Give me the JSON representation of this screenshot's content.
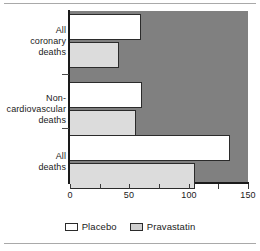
{
  "chart_data": {
    "type": "bar",
    "orientation": "horizontal",
    "title": "",
    "xlabel": "",
    "ylabel": "",
    "categories": [
      "All coronary deaths",
      "Non-cardiovascular deaths",
      "All deaths"
    ],
    "category_lines": [
      [
        "All",
        "coronary",
        "deaths"
      ],
      [
        "Non-",
        "cardiovascular",
        "deaths"
      ],
      [
        "All",
        "deaths"
      ]
    ],
    "series": [
      {
        "name": "Placebo",
        "values": [
          60,
          61,
          135
        ],
        "color": "#ffffff"
      },
      {
        "name": "Pravastatin",
        "values": [
          41,
          56,
          105
        ],
        "color": "#dcdcdc"
      }
    ],
    "xlim": [
      0,
      150
    ],
    "xticks": [
      0,
      25,
      50,
      75,
      100,
      125,
      150
    ],
    "xticklabels": [
      "0",
      "",
      "50",
      "",
      "100",
      "",
      "150"
    ],
    "grid": false,
    "legend_position": "bottom",
    "plot_background": "#808080"
  },
  "legend": {
    "entries": [
      {
        "label": "Placebo",
        "swatch": "placebo-swatch"
      },
      {
        "label": "Pravastatin",
        "swatch": "pravastatin-swatch"
      }
    ]
  },
  "axis": {
    "x_tick_labels": [
      "0",
      "50",
      "100",
      "150"
    ]
  }
}
